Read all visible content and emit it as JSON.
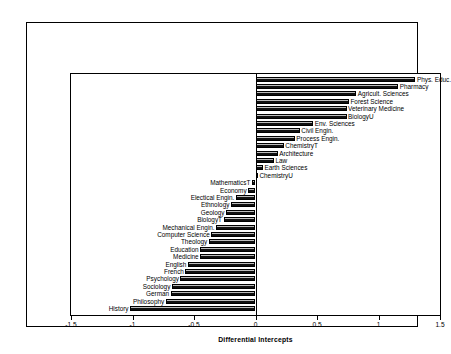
{
  "chart_data": {
    "type": "bar",
    "orientation": "horizontal",
    "title": "",
    "xlabel": "Differential Intercepts",
    "ylabel": "",
    "xlim": [
      -1.5,
      1.5
    ],
    "xticks": [
      "-1.5",
      "-1",
      "-0.5",
      "0",
      "0.5",
      "1",
      "1.5"
    ],
    "xtick_values": [
      -1.5,
      -1,
      -0.5,
      0,
      0.5,
      1,
      1.5
    ],
    "grid": false,
    "legend": "none",
    "categories": [
      "Phys. Educ.",
      "Pharmacy",
      "Agricult. Sciences",
      "Forest Science",
      "Veterinary Medicine",
      "BiologyU",
      "Env. Sciences",
      "Civil Engin.",
      "Process Engin.",
      "ChemistryT",
      "Architecture",
      "Law",
      "Earth Sciences",
      "ChemistryU",
      "MathematicsT",
      "Economy",
      "Electical Engin.",
      "Ethnology",
      "Geology",
      "BiologyT",
      "Mechanical Engin.",
      "Computer Science",
      "Theology",
      "Education",
      "Medicine",
      "English",
      "French",
      "Psychology",
      "Sociology",
      "German",
      "Philosophy",
      "History"
    ],
    "values": [
      1.3,
      1.16,
      0.82,
      0.76,
      0.74,
      0.74,
      0.47,
      0.36,
      0.32,
      0.23,
      0.18,
      0.15,
      0.06,
      0.02,
      -0.03,
      -0.06,
      -0.16,
      -0.2,
      -0.24,
      -0.26,
      -0.32,
      -0.36,
      -0.38,
      -0.45,
      -0.45,
      -0.55,
      -0.57,
      -0.61,
      -0.68,
      -0.69,
      -0.73,
      -1.02
    ]
  },
  "style": {
    "bar_fill": "#6a6a6a",
    "bar_edge": "#000000",
    "background": "#ffffff",
    "axis_color": "#000000"
  }
}
